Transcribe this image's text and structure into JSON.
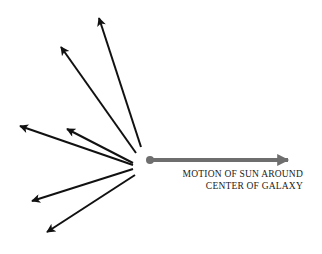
{
  "diagram": {
    "label_line1": "MOTION OF SUN AROUND",
    "label_line2": "CENTER OF GALAXY",
    "colors": {
      "star_arrows": "#111111",
      "sun_arrow": "#6e6e6e",
      "background": "#ffffff"
    },
    "star_arrows": [
      {
        "from": [
          141,
          147
        ],
        "to": [
          99,
          18
        ]
      },
      {
        "from": [
          136,
          153
        ],
        "to": [
          61,
          47
        ]
      },
      {
        "from": [
          133,
          165
        ],
        "to": [
          20,
          126
        ]
      },
      {
        "from": [
          133,
          163
        ],
        "to": [
          67,
          129
        ]
      },
      {
        "from": [
          133,
          169
        ],
        "to": [
          32,
          201
        ]
      },
      {
        "from": [
          135,
          175
        ],
        "to": [
          47,
          232
        ]
      }
    ],
    "sun_arrow": {
      "from": [
        150,
        160
      ],
      "to": [
        288,
        160
      ]
    }
  }
}
